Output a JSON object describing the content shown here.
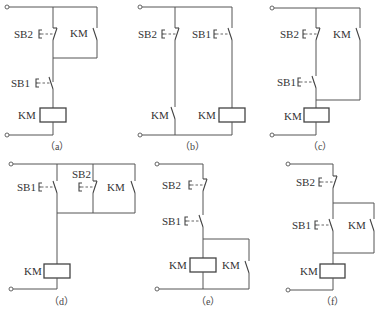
{
  "diagrams": [
    {
      "id": "a",
      "caption": "（a）",
      "labels": {
        "sb2": "SB2",
        "km_contact": "KM",
        "sb1": "SB1",
        "coil": "KM"
      }
    },
    {
      "id": "b",
      "caption": "（b）",
      "labels": {
        "sb2": "SB2",
        "sb1": "SB1",
        "km_contact": "KM",
        "coil": "KM"
      }
    },
    {
      "id": "c",
      "caption": "（c）",
      "labels": {
        "sb2": "SB2",
        "km_contact": "KM",
        "sb1": "SB1",
        "coil": "KM"
      }
    },
    {
      "id": "d",
      "caption": "（d）",
      "labels": {
        "sb1": "SB1",
        "sb2": "SB2",
        "km_contact": "KM",
        "coil": "KM"
      }
    },
    {
      "id": "e",
      "caption": "（e）",
      "labels": {
        "sb2": "SB2",
        "sb1": "SB1",
        "coil": "KM",
        "km_contact": "KM"
      }
    },
    {
      "id": "f",
      "caption": "（f）",
      "labels": {
        "sb2": "SB2",
        "sb1": "SB1",
        "km_contact": "KM",
        "coil": "KM"
      }
    }
  ],
  "symbols": {
    "button_actuator": "E",
    "nc_pushbutton": "normally-closed stop button",
    "no_pushbutton": "normally-open start button",
    "no_contact": "normally-open auxiliary contact",
    "coil": "contactor coil"
  }
}
